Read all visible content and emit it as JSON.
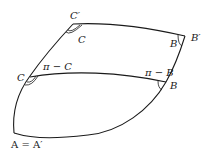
{
  "diagram": {
    "labels": {
      "c_prime": "C′",
      "c_inner_top": "C",
      "b_prime": "B′",
      "b_inner_top": "B",
      "c_left": "C",
      "pi_minus_c": "π − C",
      "pi_minus_b": "π − B",
      "b_right": "B",
      "a_equals_a_prime": "A = A′"
    },
    "vertices": [
      "A = A′",
      "C",
      "C′",
      "B",
      "B′"
    ],
    "colors": {
      "stroke": "#1a1a1a",
      "background": "#ffffff"
    }
  }
}
